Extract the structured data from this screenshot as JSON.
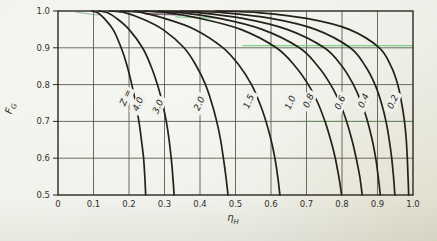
{
  "figure": {
    "kind": "scanned-textbook-chart",
    "title": ""
  },
  "chart_data": {
    "type": "line",
    "title": "",
    "xlabel_main": "η",
    "xlabel_sub": "H",
    "ylabel_main": "F",
    "ylabel_sub": "G",
    "xlim": [
      0,
      1.0
    ],
    "ylim": [
      0.5,
      1.0
    ],
    "grid": true,
    "legend_position": "none",
    "x_ticks": {
      "values": [
        0,
        0.1,
        0.2,
        0.3,
        0.4,
        0.5,
        0.6,
        0.7,
        0.8,
        0.9,
        1.0
      ],
      "labels": [
        "0",
        "0.1",
        "0.2",
        "0.3",
        "0.4",
        "0.5",
        "0.6",
        "0.7",
        "0.8",
        "0.9",
        "1.0"
      ]
    },
    "y_ticks": {
      "values": [
        1.0,
        0.9,
        0.8,
        0.7,
        0.6,
        0.5
      ],
      "labels": [
        "1.0",
        "0.9",
        "0.8",
        "0.7",
        "0.6",
        "0.5"
      ]
    },
    "series": [
      {
        "name": "4.0",
        "points": [
          [
            0.095,
            1.0
          ],
          [
            0.112,
            0.995
          ],
          [
            0.13,
            0.98
          ],
          [
            0.155,
            0.95
          ],
          [
            0.178,
            0.9
          ],
          [
            0.195,
            0.85
          ],
          [
            0.208,
            0.8
          ],
          [
            0.219,
            0.75
          ],
          [
            0.228,
            0.7
          ],
          [
            0.235,
            0.65
          ],
          [
            0.241,
            0.6
          ],
          [
            0.2445,
            0.55
          ],
          [
            0.247,
            0.5
          ]
        ]
      },
      {
        "name": "3.0",
        "points": [
          [
            0.115,
            1.0
          ],
          [
            0.14,
            0.995
          ],
          [
            0.165,
            0.98
          ],
          [
            0.2,
            0.95
          ],
          [
            0.238,
            0.9
          ],
          [
            0.262,
            0.85
          ],
          [
            0.28,
            0.8
          ],
          [
            0.294,
            0.75
          ],
          [
            0.305,
            0.7
          ],
          [
            0.313,
            0.65
          ],
          [
            0.319,
            0.6
          ],
          [
            0.3235,
            0.55
          ],
          [
            0.327,
            0.5
          ]
        ]
      },
      {
        "name": "2.0",
        "points": [
          [
            0.145,
            1.0
          ],
          [
            0.19,
            0.995
          ],
          [
            0.235,
            0.98
          ],
          [
            0.295,
            0.95
          ],
          [
            0.355,
            0.9
          ],
          [
            0.39,
            0.85
          ],
          [
            0.4155,
            0.8
          ],
          [
            0.433,
            0.75
          ],
          [
            0.447,
            0.7
          ],
          [
            0.458,
            0.65
          ],
          [
            0.466,
            0.6
          ],
          [
            0.473,
            0.55
          ],
          [
            0.479,
            0.5
          ]
        ]
      },
      {
        "name": "1.5",
        "points": [
          [
            0.175,
            1.0
          ],
          [
            0.24,
            0.995
          ],
          [
            0.3,
            0.98
          ],
          [
            0.385,
            0.95
          ],
          [
            0.465,
            0.9
          ],
          [
            0.512,
            0.85
          ],
          [
            0.545,
            0.8
          ],
          [
            0.568,
            0.75
          ],
          [
            0.586,
            0.7
          ],
          [
            0.6,
            0.65
          ],
          [
            0.611,
            0.6
          ],
          [
            0.619,
            0.55
          ],
          [
            0.625,
            0.5
          ]
        ]
      },
      {
        "name": "1.0",
        "points": [
          [
            0.215,
            1.0
          ],
          [
            0.31,
            0.995
          ],
          [
            0.4,
            0.98
          ],
          [
            0.515,
            0.95
          ],
          [
            0.615,
            0.9
          ],
          [
            0.668,
            0.85
          ],
          [
            0.705,
            0.8
          ],
          [
            0.732,
            0.75
          ],
          [
            0.752,
            0.7
          ],
          [
            0.768,
            0.65
          ],
          [
            0.781,
            0.6
          ],
          [
            0.791,
            0.55
          ],
          [
            0.799,
            0.5
          ]
        ]
      },
      {
        "name": "0.8",
        "points": [
          [
            0.245,
            1.0
          ],
          [
            0.35,
            0.995
          ],
          [
            0.455,
            0.98
          ],
          [
            0.575,
            0.95
          ],
          [
            0.68,
            0.9
          ],
          [
            0.732,
            0.85
          ],
          [
            0.768,
            0.8
          ],
          [
            0.794,
            0.75
          ],
          [
            0.813,
            0.7
          ],
          [
            0.828,
            0.65
          ],
          [
            0.84,
            0.6
          ],
          [
            0.85,
            0.55
          ],
          [
            0.857,
            0.5
          ]
        ]
      },
      {
        "name": "0.6",
        "points": [
          [
            0.285,
            1.0
          ],
          [
            0.4,
            0.995
          ],
          [
            0.52,
            0.98
          ],
          [
            0.645,
            0.95
          ],
          [
            0.75,
            0.9
          ],
          [
            0.8,
            0.85
          ],
          [
            0.832,
            0.8
          ],
          [
            0.855,
            0.75
          ],
          [
            0.872,
            0.7
          ],
          [
            0.885,
            0.65
          ],
          [
            0.895,
            0.6
          ],
          [
            0.902,
            0.55
          ],
          [
            0.908,
            0.5
          ]
        ]
      },
      {
        "name": "0.4",
        "points": [
          [
            0.345,
            1.0
          ],
          [
            0.47,
            0.995
          ],
          [
            0.6,
            0.98
          ],
          [
            0.725,
            0.95
          ],
          [
            0.823,
            0.9
          ],
          [
            0.866,
            0.85
          ],
          [
            0.893,
            0.8
          ],
          [
            0.911,
            0.75
          ],
          [
            0.924,
            0.7
          ],
          [
            0.933,
            0.65
          ],
          [
            0.94,
            0.6
          ],
          [
            0.945,
            0.55
          ],
          [
            0.949,
            0.5
          ]
        ]
      },
      {
        "name": "0.2",
        "points": [
          [
            0.445,
            1.0
          ],
          [
            0.57,
            0.995
          ],
          [
            0.7,
            0.98
          ],
          [
            0.82,
            0.95
          ],
          [
            0.905,
            0.9
          ],
          [
            0.938,
            0.85
          ],
          [
            0.957,
            0.8
          ],
          [
            0.968,
            0.75
          ],
          [
            0.976,
            0.7
          ],
          [
            0.981,
            0.65
          ],
          [
            0.984,
            0.6
          ],
          [
            0.986,
            0.55
          ],
          [
            0.988,
            0.5
          ]
        ]
      }
    ],
    "curve_labels": [
      {
        "text": "Z =",
        "eta": 0.198,
        "f": 0.762
      },
      {
        "text": "4.0",
        "eta": 0.233,
        "f": 0.744
      },
      {
        "text": "3.0",
        "eta": 0.289,
        "f": 0.737
      },
      {
        "text": "2.0",
        "eta": 0.405,
        "f": 0.745
      },
      {
        "text": "1.5",
        "eta": 0.545,
        "f": 0.751
      },
      {
        "text": "1.0",
        "eta": 0.662,
        "f": 0.748
      },
      {
        "text": "0.8",
        "eta": 0.713,
        "f": 0.753
      },
      {
        "text": "0.6",
        "eta": 0.802,
        "f": 0.748
      },
      {
        "text": "0.4",
        "eta": 0.868,
        "f": 0.753
      },
      {
        "text": "0.2",
        "eta": 0.95,
        "f": 0.75
      }
    ],
    "label_angle": -66,
    "colors": {
      "paper": "#f0f1ea",
      "curve": "#24211b",
      "grid": "#57544b",
      "frame": "#2c2923",
      "text": "#33312b",
      "artifact_green": "#74cd7c",
      "artifact_purple": "#5e3a52",
      "artifact_teal": "#4f9b8f"
    },
    "scan_artifacts": [
      {
        "name": "green-line-right-of-0.9",
        "color": "#74cd7c",
        "width": 1.2,
        "opacity": 0.9,
        "x1": 0.52,
        "y1": 0.906,
        "x2": 1.0,
        "y2": 0.906
      },
      {
        "name": "green-tint-0.7-gridline",
        "color": "#58a05c",
        "width": 1.0,
        "opacity": 0.55,
        "x1": 0.68,
        "y1": 0.7,
        "x2": 1.0,
        "y2": 0.7
      },
      {
        "name": "purple-smear-top",
        "color": "#5e3a52",
        "width": 1.7,
        "opacity": 0.75,
        "x1": 0.245,
        "y1": 0.992,
        "x2": 0.345,
        "y2": 0.99
      },
      {
        "name": "green-smear-top",
        "color": "#74c98c",
        "width": 1.5,
        "opacity": 0.7,
        "x1": 0.33,
        "y1": 0.984,
        "x2": 0.445,
        "y2": 0.981
      },
      {
        "name": "teal-smear-topleft",
        "color": "#4f9b8f",
        "width": 1.2,
        "opacity": 0.5,
        "x1": 0.05,
        "y1": 0.997,
        "x2": 0.115,
        "y2": 0.989
      }
    ]
  }
}
